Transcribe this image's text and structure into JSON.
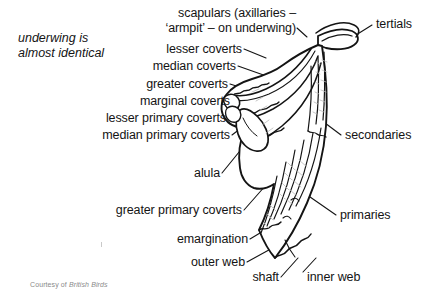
{
  "figure": {
    "background_color": "#ffffff",
    "ink_color": "#141414"
  },
  "note": {
    "line1": "underwing is",
    "line2": "almost identical"
  },
  "labels_left": [
    {
      "id": "scapulars",
      "line1": "scapulars (axillaries –",
      "line2": "‘armpit’ – on underwing)"
    },
    {
      "id": "lesser-coverts",
      "text": "lesser coverts"
    },
    {
      "id": "median-coverts",
      "text": "median coverts"
    },
    {
      "id": "greater-coverts",
      "text": "greater coverts"
    },
    {
      "id": "marginal-coverts",
      "text": "marginal coverts"
    },
    {
      "id": "lesser-primary-coverts",
      "text": "lesser primary coverts"
    },
    {
      "id": "median-primary-coverts",
      "text": "median primary coverts"
    },
    {
      "id": "alula",
      "text": "alula"
    },
    {
      "id": "greater-primary-coverts",
      "text": "greater primary coverts"
    },
    {
      "id": "emargination",
      "text": "emargination"
    },
    {
      "id": "outer-web",
      "text": "outer web"
    },
    {
      "id": "shaft",
      "text": "shaft"
    }
  ],
  "labels_right": [
    {
      "id": "tertials",
      "text": "tertials"
    },
    {
      "id": "secondaries",
      "text": "secondaries"
    },
    {
      "id": "primaries",
      "text": "primaries"
    },
    {
      "id": "inner-web",
      "text": "inner web"
    }
  ],
  "credit": {
    "prefix": "Courtesy of ",
    "source": "British Birds"
  }
}
